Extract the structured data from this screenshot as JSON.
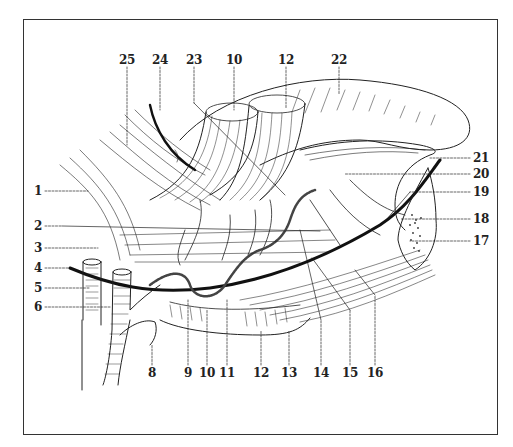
{
  "figure": {
    "type": "anatomical-illustration",
    "labels": {
      "top": [
        {
          "id": "25",
          "text": "25",
          "x": 127,
          "y": 60
        },
        {
          "id": "24",
          "text": "24",
          "x": 160,
          "y": 60
        },
        {
          "id": "23",
          "text": "23",
          "x": 194,
          "y": 60
        },
        {
          "id": "10t",
          "text": "10",
          "x": 234,
          "y": 60
        },
        {
          "id": "12t",
          "text": "12",
          "x": 286,
          "y": 60
        },
        {
          "id": "22",
          "text": "22",
          "x": 339,
          "y": 60
        }
      ],
      "left": [
        {
          "id": "1",
          "text": "1",
          "x": 38,
          "y": 191
        },
        {
          "id": "2",
          "text": "2",
          "x": 38,
          "y": 226
        },
        {
          "id": "3",
          "text": "3",
          "x": 38,
          "y": 248
        },
        {
          "id": "4",
          "text": "4",
          "x": 38,
          "y": 268
        },
        {
          "id": "5",
          "text": "5",
          "x": 38,
          "y": 288
        },
        {
          "id": "6",
          "text": "6",
          "x": 38,
          "y": 307
        }
      ],
      "bottom": [
        {
          "id": "8",
          "text": "8",
          "x": 152,
          "y": 373
        },
        {
          "id": "9",
          "text": "9",
          "x": 188,
          "y": 373
        },
        {
          "id": "10b",
          "text": "10",
          "x": 207,
          "y": 373
        },
        {
          "id": "11",
          "text": "11",
          "x": 227,
          "y": 373
        },
        {
          "id": "12b",
          "text": "12",
          "x": 261,
          "y": 373
        },
        {
          "id": "13",
          "text": "13",
          "x": 289,
          "y": 373
        },
        {
          "id": "14",
          "text": "14",
          "x": 321,
          "y": 373
        },
        {
          "id": "15",
          "text": "15",
          "x": 350,
          "y": 373
        },
        {
          "id": "16",
          "text": "16",
          "x": 375,
          "y": 373
        }
      ],
      "right": [
        {
          "id": "21",
          "text": "21",
          "x": 481,
          "y": 158
        },
        {
          "id": "20",
          "text": "20",
          "x": 481,
          "y": 174
        },
        {
          "id": "19",
          "text": "19",
          "x": 481,
          "y": 192
        },
        {
          "id": "18",
          "text": "18",
          "x": 481,
          "y": 219
        },
        {
          "id": "17",
          "text": "17",
          "x": 481,
          "y": 241
        }
      ]
    },
    "colors": {
      "ink": "#222222",
      "frame": "#333333",
      "background": "#ffffff"
    }
  }
}
